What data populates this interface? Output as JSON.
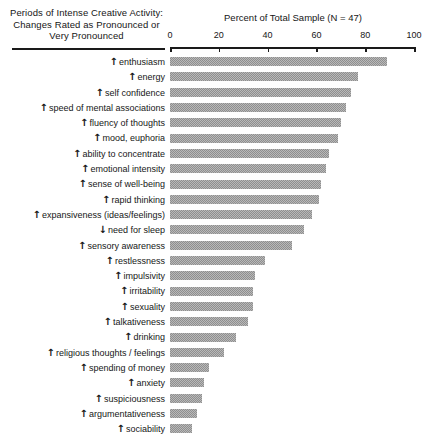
{
  "header": {
    "left_title_lines": [
      "Periods of Intense Creative Activity:",
      "Changes Rated as Pronounced or",
      "Very Pronounced"
    ],
    "axis_title": "Percent of Total Sample (N = 47)"
  },
  "chart_data": {
    "type": "bar",
    "orientation": "horizontal",
    "title": "Periods of Intense Creative Activity: Changes Rated as Pronounced or Very Pronounced",
    "xlabel": "Percent of Total Sample (N = 47)",
    "ylabel": "",
    "xlim": [
      0,
      100
    ],
    "xticks": [
      0,
      20,
      40,
      60,
      80,
      100
    ],
    "xtick_labels": [
      "0",
      "20",
      "40",
      "60",
      "80",
      "100"
    ],
    "grid": false,
    "legend": false,
    "sample_size": 47,
    "bar_color": "#b9b9b9",
    "categories": [
      "enthusiasm",
      "energy",
      "self confidence",
      "speed of mental associations",
      "fluency of thoughts",
      "mood, euphoria",
      "ability to concentrate",
      "emotional intensity",
      "sense of well-being",
      "rapid thinking",
      "expansiveness (ideas/feelings)",
      "need for sleep",
      "sensory awareness",
      "restlessness",
      "impulsivity",
      "irritability",
      "sexuality",
      "talkativeness",
      "drinking",
      "religious thoughts / feelings",
      "spending of money",
      "anxiety",
      "suspiciousness",
      "argumentativeness",
      "sociability"
    ],
    "directions": [
      "up",
      "up",
      "up",
      "up",
      "up",
      "up",
      "up",
      "up",
      "up",
      "up",
      "up",
      "down",
      "up",
      "up",
      "up",
      "up",
      "up",
      "up",
      "up",
      "up",
      "up",
      "up",
      "up",
      "up",
      "up"
    ],
    "values": [
      89,
      77,
      74,
      72,
      70,
      69,
      65,
      64,
      62,
      61,
      58,
      55,
      50,
      39,
      35,
      34,
      34,
      32,
      27,
      22,
      16,
      14,
      13,
      11,
      9
    ]
  },
  "arrows": {
    "up": "↑",
    "down": "↓"
  }
}
